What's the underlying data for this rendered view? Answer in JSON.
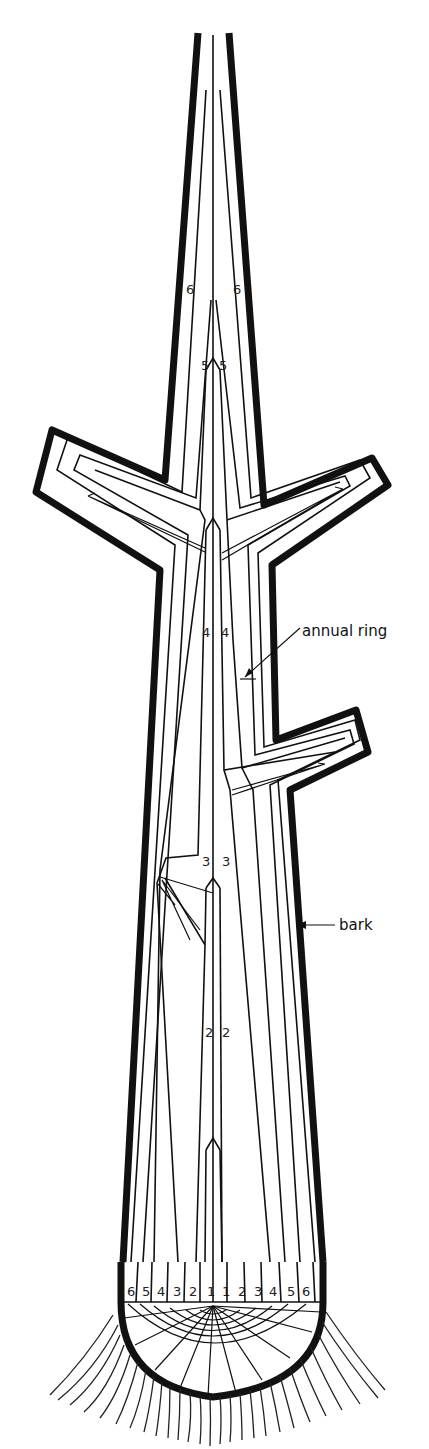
{
  "diagram": {
    "colors": {
      "ink": "#111111",
      "background": "#ffffff"
    },
    "labels": {
      "annual_ring": "annual ring",
      "bark": "bark"
    },
    "stem_numbers": {
      "six_left": "6",
      "six_right": "6",
      "five_left": "5",
      "five_right": "5",
      "four_left": "4",
      "four_right": "4",
      "three_left": "3",
      "three_right": "3",
      "two_left": "2",
      "two_right": "2"
    },
    "base_numbers": [
      "6",
      "5",
      "4",
      "3",
      "2",
      "1",
      "1",
      "2",
      "3",
      "4",
      "5",
      "6"
    ]
  }
}
